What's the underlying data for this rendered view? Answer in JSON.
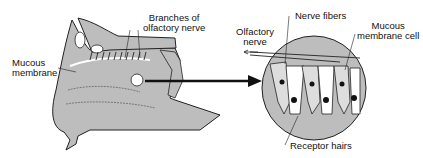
{
  "diagram": {
    "labels": {
      "branches_line1": "Branches of",
      "branches_line2": "olfactory nerve",
      "mucous_line1": "Mucous",
      "mucous_line2": "membrane",
      "olfactory_line1": "Olfactory",
      "olfactory_line2": "nerve",
      "nerve_fibers": "Nerve fibers",
      "cell_line1": "Mucous",
      "cell_line2": "membrane cell",
      "receptor_hairs": "Receptor hairs"
    },
    "colors": {
      "tissue": "#bdbdbd",
      "outline": "#222222",
      "background": "#ffffff"
    }
  }
}
